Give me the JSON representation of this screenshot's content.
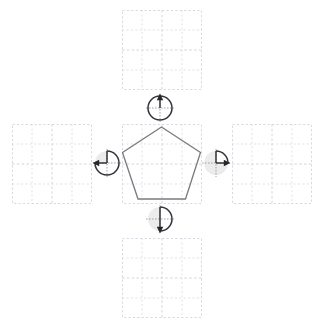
{
  "canvas": {
    "width": 316,
    "height": 321,
    "background": "#ffffff",
    "title": "Rotation transformation puzzle"
  },
  "colors": {
    "grid_border": "#d8d8e0",
    "grid_line": "#e3e3ea",
    "grid_center_line": "#d5d5de",
    "shape_stroke": "#7a7a80",
    "dial_disc": "#ececed",
    "dial_wedge": "#ffffff",
    "dial_arc": "#333338",
    "dial_axis": "#9a9aa2",
    "dial_arrow": "#26262b"
  },
  "grid": {
    "cells_per_side": 4,
    "panel_size": 80,
    "cell_size": 20
  },
  "panels": [
    {
      "id": "panel-center",
      "name": "center-panel",
      "position": "center",
      "x": 122,
      "y": 124,
      "size": 80,
      "filled": true,
      "content_label": "pentagon"
    },
    {
      "id": "panel-top",
      "name": "top-panel",
      "position": "top",
      "x": 122,
      "y": 10,
      "size": 80,
      "filled": false,
      "content_label": ""
    },
    {
      "id": "panel-left",
      "name": "left-panel",
      "position": "left",
      "x": 12,
      "y": 124,
      "size": 80,
      "filled": false,
      "content_label": ""
    },
    {
      "id": "panel-right",
      "name": "right-panel",
      "position": "right",
      "x": 232,
      "y": 124,
      "size": 80,
      "filled": false,
      "content_label": ""
    },
    {
      "id": "panel-bottom",
      "name": "bottom-panel",
      "position": "bottom",
      "x": 122,
      "y": 238,
      "size": 80,
      "filled": false,
      "content_label": ""
    }
  ],
  "shape": {
    "name": "pentagon",
    "sides": 5,
    "stroke": "#7a7a80",
    "points": "161.5,127 200.5,152.5 185.5,199 138,199 122.5,152.5"
  },
  "dials": [
    {
      "id": "dial-top",
      "name": "rotation-dial-top",
      "target_panel": "top",
      "cx": 160,
      "cy": 108,
      "r": 12,
      "angle_degrees": 360,
      "angle_label": "360°",
      "direction": "clockwise",
      "arrow_at": "top",
      "wedge_start_deg": 0,
      "wedge_sweep_deg": 360
    },
    {
      "id": "dial-left",
      "name": "rotation-dial-left",
      "target_panel": "left",
      "cx": 107,
      "cy": 163,
      "r": 12,
      "angle_degrees": 270,
      "angle_label": "270°",
      "direction": "clockwise",
      "arrow_at": "left",
      "wedge_start_deg": 0,
      "wedge_sweep_deg": 270
    },
    {
      "id": "dial-right",
      "name": "rotation-dial-right",
      "target_panel": "right",
      "cx": 216,
      "cy": 163,
      "r": 12,
      "angle_degrees": 90,
      "angle_label": "90°",
      "direction": "clockwise",
      "arrow_at": "right",
      "wedge_start_deg": 0,
      "wedge_sweep_deg": 90
    },
    {
      "id": "dial-bottom",
      "name": "rotation-dial-bottom",
      "target_panel": "bottom",
      "cx": 160,
      "cy": 219,
      "r": 12,
      "angle_degrees": 180,
      "angle_label": "180°",
      "direction": "clockwise",
      "arrow_at": "bottom",
      "wedge_start_deg": 0,
      "wedge_sweep_deg": 180
    }
  ]
}
